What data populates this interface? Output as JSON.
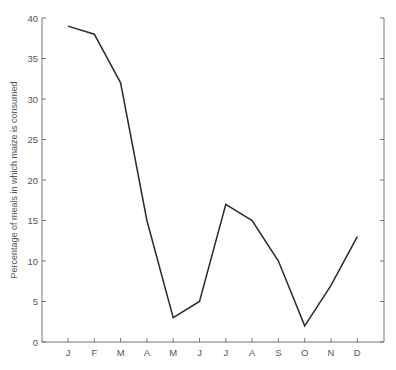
{
  "chart_data": {
    "type": "line",
    "title": "",
    "xlabel": "",
    "ylabel": "Percentage of meals in which maize is consumed",
    "categories": [
      "J",
      "F",
      "M",
      "A",
      "M",
      "J",
      "J",
      "A",
      "S",
      "O",
      "N",
      "D"
    ],
    "series": [
      {
        "name": "Maize consumption",
        "values": [
          39,
          38,
          32,
          15,
          3,
          5,
          17,
          15,
          10,
          2,
          7,
          13
        ]
      }
    ],
    "ylim": [
      0,
      40
    ],
    "yticks": [
      0,
      5,
      10,
      15,
      20,
      25,
      30,
      35,
      40
    ],
    "ytick_labels": [
      "0",
      "5",
      "10",
      "15",
      "20",
      "25",
      "30",
      "35",
      "40"
    ],
    "grid": false,
    "legend": "none",
    "right_axis_ticks": true,
    "line_color": "#2a2a2a",
    "axis_color": "#777777"
  }
}
